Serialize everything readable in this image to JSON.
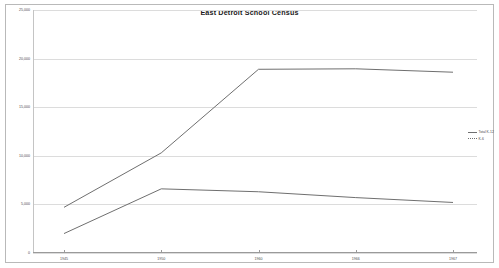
{
  "chart_data": {
    "type": "line",
    "title": "East Detroit School Census",
    "xlabel": "",
    "ylabel": "",
    "categories": [
      "1945",
      "1950",
      "1960",
      "1966",
      "1967"
    ],
    "x": [
      1945,
      1950,
      1960,
      1966,
      1967
    ],
    "ylim": [
      0,
      25000
    ],
    "yticks": [
      0,
      5000,
      10000,
      15000,
      20000,
      25000
    ],
    "ytick_labels": [
      "0",
      "5,000",
      "10,000",
      "15,000",
      "20,000",
      "25,000"
    ],
    "grid": true,
    "legend_position": "right",
    "series": [
      {
        "name": "Total K-12",
        "values": [
          4700,
          10300,
          18900,
          18950,
          18600
        ]
      },
      {
        "name": "K-6",
        "values": [
          2000,
          6600,
          6300,
          5700,
          5200
        ]
      }
    ]
  },
  "legend": {
    "entries": [
      {
        "label": "Total K-12",
        "style": "solid"
      },
      {
        "label": "K-6",
        "style": "dashed"
      }
    ]
  }
}
